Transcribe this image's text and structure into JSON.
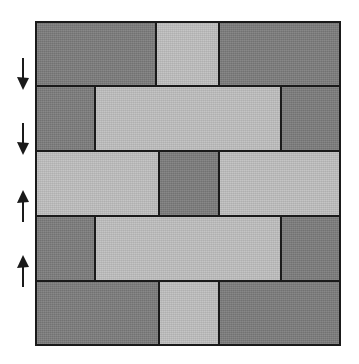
{
  "figure": {
    "background_color": "#ffffff",
    "width": 359,
    "height": 364
  },
  "wall": {
    "name": "brick-wall",
    "x": 35,
    "y": 21,
    "width": 306,
    "height": 325,
    "outline_color": "#1a1a1a",
    "outline_width": 2,
    "mortar_color": "#1a1a1a",
    "colors": {
      "dark": "#7d7d7d",
      "light": "#c0c0c0"
    },
    "rows": [
      {
        "index": 1,
        "y": 0,
        "height": 64,
        "bricks": [
          {
            "label": "",
            "shade": "dark",
            "x": 0,
            "width": 120
          },
          {
            "label": "",
            "shade": "light",
            "x": 120,
            "width": 63
          },
          {
            "label": "",
            "shade": "dark",
            "x": 183,
            "width": 119
          }
        ]
      },
      {
        "index": 2,
        "y": 64,
        "height": 65,
        "bricks": [
          {
            "label": "",
            "shade": "dark",
            "x": 0,
            "width": 59
          },
          {
            "label": "",
            "shade": "light",
            "x": 59,
            "width": 186
          },
          {
            "label": "",
            "shade": "dark",
            "x": 245,
            "width": 57
          }
        ]
      },
      {
        "index": 3,
        "y": 129,
        "height": 65,
        "bricks": [
          {
            "label": "",
            "shade": "light",
            "x": 0,
            "width": 123
          },
          {
            "label": "",
            "shade": "dark",
            "x": 123,
            "width": 60
          },
          {
            "label": "",
            "shade": "light",
            "x": 183,
            "width": 119
          }
        ]
      },
      {
        "index": 4,
        "y": 194,
        "height": 65,
        "bricks": [
          {
            "label": "",
            "shade": "dark",
            "x": 0,
            "width": 59
          },
          {
            "label": "",
            "shade": "light",
            "x": 59,
            "width": 186
          },
          {
            "label": "",
            "shade": "dark",
            "x": 245,
            "width": 57
          }
        ]
      },
      {
        "index": 5,
        "y": 259,
        "height": 62,
        "bricks": [
          {
            "label": "",
            "shade": "dark",
            "x": 0,
            "width": 123
          },
          {
            "label": "",
            "shade": "light",
            "x": 123,
            "width": 60
          },
          {
            "label": "",
            "shade": "dark",
            "x": 183,
            "width": 119
          }
        ]
      }
    ]
  },
  "arrows": [
    {
      "name": "arrow-down-1",
      "direction": "down",
      "x": 14,
      "y": 57,
      "color": "#1a1a1a"
    },
    {
      "name": "arrow-down-2",
      "direction": "down",
      "x": 14,
      "y": 122,
      "color": "#1a1a1a"
    },
    {
      "name": "arrow-up-1",
      "direction": "up",
      "x": 14,
      "y": 189,
      "color": "#1a1a1a"
    },
    {
      "name": "arrow-up-2",
      "direction": "up",
      "x": 14,
      "y": 254,
      "color": "#1a1a1a"
    }
  ]
}
